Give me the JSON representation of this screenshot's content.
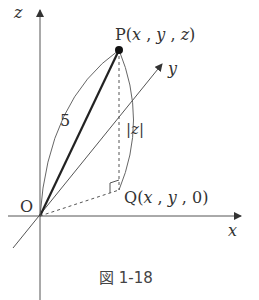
{
  "figure": {
    "caption": "図 1-18",
    "colors": {
      "line": "#555555",
      "text": "#333333",
      "bold": "#222222"
    }
  },
  "axes": {
    "x": {
      "label": "x"
    },
    "y": {
      "label": "y"
    },
    "z": {
      "label": "z"
    }
  },
  "points": {
    "origin": {
      "label": "O"
    },
    "P": {
      "name": "P",
      "open": "(",
      "x": "x",
      "sep1": " , ",
      "y": "y",
      "sep2": " , ",
      "z": "z",
      "close": ")"
    },
    "Q": {
      "name": "Q",
      "open": "(",
      "x": "x",
      "sep1": " , ",
      "y": "y",
      "sep2": " , ",
      "zero": "0",
      "close": ")"
    }
  },
  "annotations": {
    "op_length": "5",
    "pq_length": "|z|"
  }
}
